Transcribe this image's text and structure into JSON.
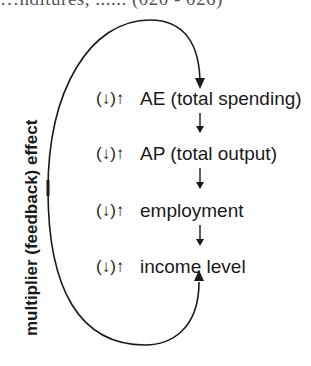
{
  "cut_title": "…nditures, ...... (020 - 026)",
  "side_label": "multiplier (feedback) effect",
  "rows": [
    {
      "symbol": "(↓)↑",
      "label": "AE (total spending)"
    },
    {
      "symbol": "(↓)↑",
      "label": "AP (total output)"
    },
    {
      "symbol": "(↓)↑",
      "label": "employment"
    },
    {
      "symbol": "(↓)↑",
      "label": "income level"
    }
  ],
  "colors": {
    "line": "#1a1a1a",
    "background": "#ffffff"
  }
}
